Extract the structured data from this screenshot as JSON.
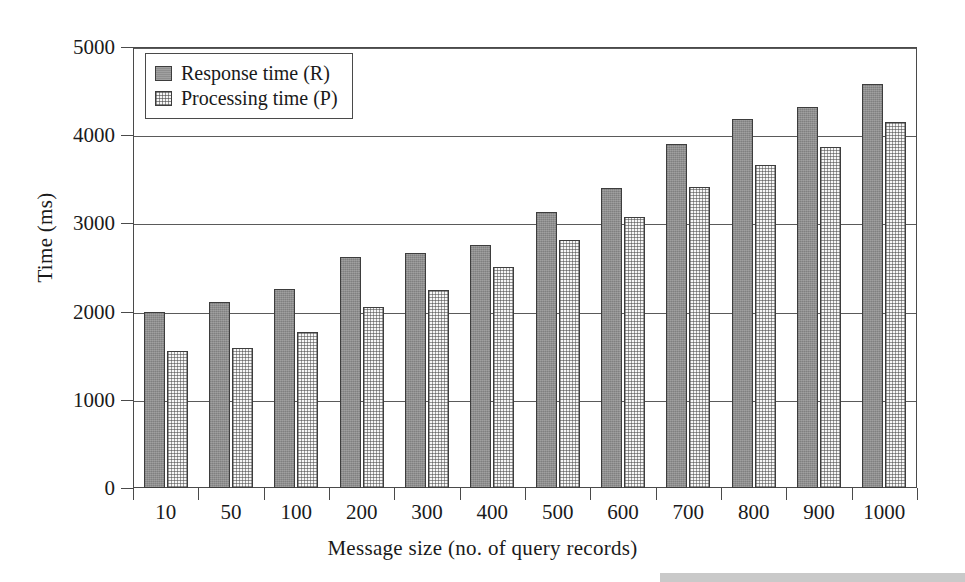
{
  "chart_data": {
    "type": "bar",
    "title": "",
    "subtitle": "",
    "xlabel": "Message size (no. of query records)",
    "ylabel": "Time (ms)",
    "categories": [
      "10",
      "50",
      "100",
      "200",
      "300",
      "400",
      "500",
      "600",
      "700",
      "800",
      "900",
      "1000"
    ],
    "series": [
      {
        "name": "Response time (R)",
        "key": "response",
        "values": [
          2000,
          2110,
          2260,
          2620,
          2670,
          2760,
          3130,
          3400,
          3900,
          4180,
          4320,
          4580
        ]
      },
      {
        "name": "Processing time (P)",
        "key": "processing",
        "values": [
          1550,
          1590,
          1770,
          2050,
          2240,
          2510,
          2810,
          3070,
          3410,
          3660,
          3870,
          4150
        ]
      }
    ],
    "ylim": [
      0,
      5000
    ],
    "yticks": [
      0,
      1000,
      2000,
      3000,
      4000,
      5000
    ],
    "ytick_labels": [
      "0",
      "1000",
      "2000",
      "3000",
      "4000",
      "5000"
    ],
    "grid": true,
    "grid_axis": "y",
    "legend_position": "top-left-inside",
    "bar_border_color": "#3d3d3d",
    "colors": {
      "response": "#8e8e8e",
      "processing": "#f7f7f7",
      "axis": "#4a4a4a",
      "grid": "#5a5a5a",
      "text": "#1a1a1a"
    }
  },
  "legend": {
    "items": [
      {
        "label": "Response time (R)",
        "key": "response"
      },
      {
        "label": "Processing time (P)",
        "key": "processing"
      }
    ]
  }
}
